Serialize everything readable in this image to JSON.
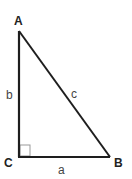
{
  "diagram": {
    "type": "right-triangle",
    "vertices": {
      "A": {
        "label": "A",
        "x": 19,
        "y": 31
      },
      "B": {
        "label": "B",
        "x": 110,
        "y": 157
      },
      "C": {
        "label": "C",
        "x": 19,
        "y": 157
      }
    },
    "sides": {
      "a": {
        "label": "a",
        "from": "C",
        "to": "B"
      },
      "b": {
        "label": "b",
        "from": "C",
        "to": "A"
      },
      "c": {
        "label": "c",
        "from": "A",
        "to": "B"
      }
    },
    "right_angle_at": "C",
    "colors": {
      "line": "#1e1e1e",
      "vertex_label": "#222222",
      "side_label": "#444444",
      "right_angle_marker": "#888888"
    }
  }
}
